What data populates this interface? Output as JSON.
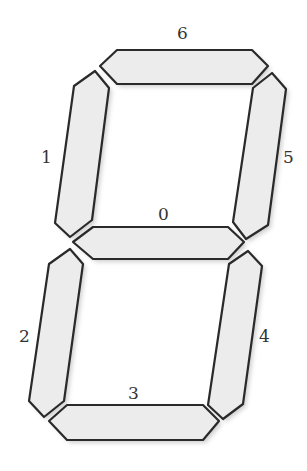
{
  "diagram": {
    "type": "seven-segment-display",
    "segment_fill": "#ececec",
    "segment_stroke": "#2a2a2a",
    "segments": [
      {
        "id": "0",
        "position": "middle",
        "points": "73,242 93,227 228,227 244,242 228,259 93,259",
        "label": "0",
        "label_x": 158,
        "label_y": 220
      },
      {
        "id": "1",
        "position": "upper-left",
        "points": "95,71 109,88 92,220 70,237 55,223 74,86",
        "label": "1",
        "label_x": 41,
        "label_y": 163
      },
      {
        "id": "2",
        "position": "lower-left",
        "points": "70,249 83,264 64,401 44,417 29,401 49,264",
        "label": "2",
        "label_x": 19,
        "label_y": 342
      },
      {
        "id": "3",
        "position": "bottom",
        "points": "49,421 67,405 203,405 219,421 203,440 67,440",
        "label": "3",
        "label_x": 128,
        "label_y": 399
      },
      {
        "id": "4",
        "position": "lower-right",
        "points": "248,251 262,266 243,404 223,419 208,405 229,264",
        "label": "4",
        "label_x": 259,
        "label_y": 342
      },
      {
        "id": "5",
        "position": "upper-right",
        "points": "272,73 286,89 268,225 246,239 233,222 253,88",
        "label": "5",
        "label_x": 283,
        "label_y": 163
      },
      {
        "id": "6",
        "position": "top",
        "points": "100,66 117,50 252,50 268,66 252,84 117,84",
        "label": "6",
        "label_x": 177,
        "label_y": 39
      }
    ]
  }
}
